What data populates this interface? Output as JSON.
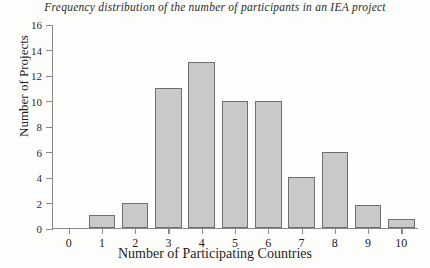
{
  "chart_data": {
    "type": "bar",
    "title": "Frequency distribution of the number of participants in an IEA project",
    "xlabel": "Number of Participating Countries",
    "ylabel": "Number of Projects",
    "categories": [
      "0",
      "1",
      "2",
      "3",
      "4",
      "5",
      "6",
      "7",
      "8",
      "9",
      "10"
    ],
    "values": [
      0,
      1,
      2,
      11,
      13,
      10,
      10,
      4,
      6,
      1.8,
      0.7
    ],
    "ylim": [
      0,
      16
    ],
    "yticks": [
      "0",
      "2",
      "4",
      "6",
      "8",
      "10",
      "12",
      "14",
      "16"
    ],
    "ytick_values": [
      0,
      2,
      4,
      6,
      8,
      10,
      12,
      14,
      16
    ],
    "xlim": [
      -0.5,
      10.5
    ],
    "grid": false,
    "legend": null,
    "bar_fill_color": "#c9c9c7",
    "bar_edge_color": "#6f6f6f",
    "axis_color": "#8a8a8a",
    "text_color": "#1d1d1d",
    "background_color": "#fdfdfc"
  }
}
